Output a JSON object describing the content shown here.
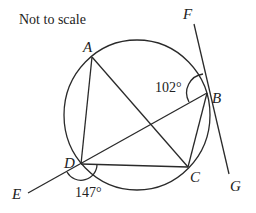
{
  "note": "Not to scale",
  "points": {
    "A": {
      "label": "A",
      "x": 92,
      "y": 57
    },
    "B": {
      "label": "B",
      "x": 207,
      "y": 93
    },
    "C": {
      "label": "C",
      "x": 188,
      "y": 167
    },
    "D": {
      "label": "D",
      "x": 81,
      "y": 164
    },
    "E": {
      "label": "E",
      "x": 28,
      "y": 193
    },
    "F": {
      "label": "F",
      "x": 194,
      "y": 23
    },
    "G": {
      "label": "G",
      "x": 229,
      "y": 175
    }
  },
  "angles": {
    "FBD": "102°",
    "EDC": "147°"
  },
  "circle": {
    "cx": 137,
    "cy": 115,
    "r": 74
  },
  "colors": {
    "line": "#2a2a2a",
    "background": "#ffffff"
  }
}
